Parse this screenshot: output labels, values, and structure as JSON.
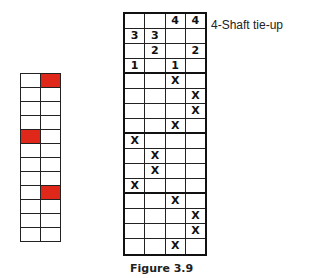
{
  "tieup_label": "4-Shaft tie-up",
  "caption": "Figure 3.9",
  "colors": {
    "fill": "#e0281a",
    "line": "#111111"
  },
  "left_grid": {
    "rows": 12,
    "cols": 2,
    "filled": [
      [
        0,
        1
      ],
      [
        4,
        0
      ],
      [
        8,
        1
      ]
    ]
  },
  "right_grid": {
    "tieup": [
      [
        "",
        "",
        "4",
        "4"
      ],
      [
        "3",
        "3",
        "",
        ""
      ],
      [
        "",
        "2",
        "",
        "2"
      ],
      [
        "1",
        "",
        "1",
        ""
      ]
    ],
    "threading": [
      [
        "",
        "",
        "X",
        ""
      ],
      [
        "",
        "",
        "",
        "X"
      ],
      [
        "",
        "",
        "",
        "X"
      ],
      [
        "",
        "",
        "X",
        ""
      ],
      [
        "X",
        "",
        "",
        ""
      ],
      [
        "",
        "X",
        "",
        ""
      ],
      [
        "",
        "X",
        "",
        ""
      ],
      [
        "X",
        "",
        "",
        ""
      ],
      [
        "",
        "",
        "X",
        ""
      ],
      [
        "",
        "",
        "",
        "X"
      ],
      [
        "",
        "",
        "",
        "X"
      ],
      [
        "",
        "",
        "X",
        ""
      ]
    ]
  }
}
